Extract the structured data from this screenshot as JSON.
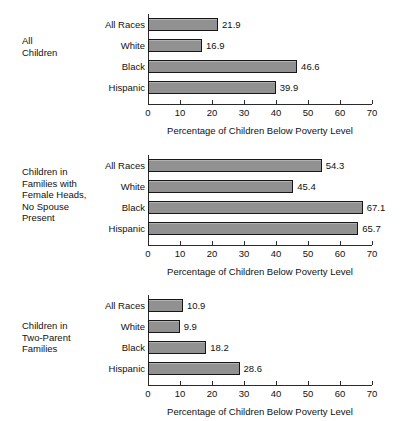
{
  "chart_data": {
    "type": "bar",
    "orientation": "horizontal",
    "title": "",
    "xlabel": "Percentage of Children Below Poverty Level",
    "ylabel": "",
    "xlim": [
      0,
      70
    ],
    "xticks": [
      0,
      10,
      20,
      30,
      40,
      50,
      60,
      70
    ],
    "grid": false,
    "legend": false,
    "categories": [
      "All Races",
      "White",
      "Black",
      "Hispanic"
    ],
    "panels": [
      {
        "caption_lines": [
          "All",
          "Children"
        ],
        "categories": [
          "All Races",
          "White",
          "Black",
          "Hispanic"
        ],
        "values": [
          21.9,
          16.9,
          46.6,
          39.9
        ],
        "value_labels": [
          "21.9",
          "16.9",
          "46.6",
          "39.9"
        ],
        "xlabel": "Percentage of Children Below Poverty Level"
      },
      {
        "caption_lines": [
          "Children in",
          "Families with",
          "Female Heads,",
          "No Spouse",
          "Present"
        ],
        "categories": [
          "All Races",
          "White",
          "Black",
          "Hispanic"
        ],
        "values": [
          54.3,
          45.4,
          67.1,
          65.7
        ],
        "value_labels": [
          "54.3",
          "45.4",
          "67.1",
          "65.7"
        ],
        "xlabel": "Percentage of Children Below Poverty Level"
      },
      {
        "caption_lines": [
          "Children in",
          "Two-Parent",
          "Families"
        ],
        "categories": [
          "All Races",
          "White",
          "Black",
          "Hispanic"
        ],
        "values": [
          10.9,
          9.9,
          18.2,
          28.6
        ],
        "value_labels": [
          "10.9",
          "9.9",
          "18.2",
          "28.6"
        ],
        "xlabel": "Percentage of Children Below Poverty Level"
      }
    ],
    "colors": {
      "bar_fill": "#919191",
      "bar_border": "#171717",
      "axis": "#2a2a2a",
      "text": "#111111",
      "background": "#ffffff"
    }
  }
}
